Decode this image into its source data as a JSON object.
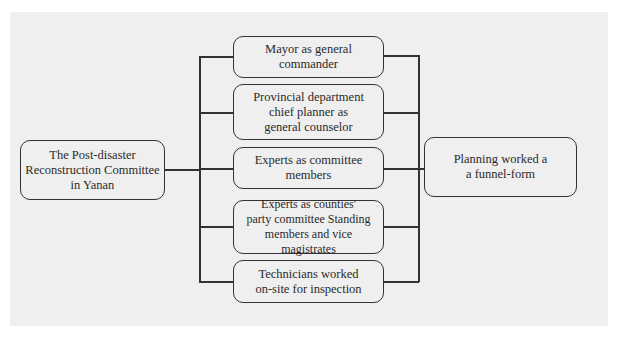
{
  "diagram": {
    "source": {
      "id": "committee",
      "label": "The Post-disaster\nReconstruction Committee\nin Yanan"
    },
    "members": [
      {
        "id": "mayor",
        "label": "Mayor as general\ncommander"
      },
      {
        "id": "chief-planner",
        "label": "Provincial department\nchief planner as\ngeneral counselor"
      },
      {
        "id": "experts-committee",
        "label": "Experts as committee\nmembers"
      },
      {
        "id": "experts-counties",
        "label": "Experts as counties'\nparty committee Standing\nmembers and vice magistrates"
      },
      {
        "id": "technicians",
        "label": "Technicians worked\non-site for inspection"
      }
    ],
    "target": {
      "id": "funnel",
      "label": "Planning worked a\na funnel-form"
    },
    "edges": [
      {
        "from": "committee",
        "to": "mayor"
      },
      {
        "from": "committee",
        "to": "chief-planner"
      },
      {
        "from": "committee",
        "to": "experts-committee"
      },
      {
        "from": "committee",
        "to": "experts-counties"
      },
      {
        "from": "committee",
        "to": "technicians"
      },
      {
        "from": "mayor",
        "to": "funnel"
      },
      {
        "from": "chief-planner",
        "to": "funnel"
      },
      {
        "from": "experts-committee",
        "to": "funnel"
      },
      {
        "from": "experts-counties",
        "to": "funnel"
      },
      {
        "from": "technicians",
        "to": "funnel"
      }
    ]
  },
  "colors": {
    "panel": "#efefef",
    "stroke": "#333333",
    "text": "#2a2a2a"
  }
}
